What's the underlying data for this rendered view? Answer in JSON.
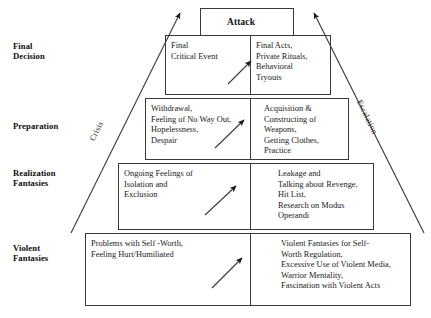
{
  "diagram": {
    "title_box": {
      "label": "Attack"
    },
    "side_labels": {
      "left": "Crisis",
      "right": "Escalation"
    },
    "stages": [
      {
        "name": "final-decision",
        "label": "Final\nDecision",
        "left_cell": "Final\nCritical Event",
        "right_cell": "Final Acts,\nPrivate Rituals,\nBehavioral\nTryouts"
      },
      {
        "name": "preparation",
        "label": "Preparation",
        "left_cell": "Withdrawal,\nFeeling of No Way Out,\nHopelessness,\nDespair",
        "right_cell": "Acquisition &\nConstructing of\nWeapons,\nGetting Clothes,\nPractice"
      },
      {
        "name": "realization-fantasies",
        "label": "Realization\nFantasies",
        "left_cell": "Ongoing Feelings of\nIsolation and\nExclusion",
        "right_cell": "Leakage and\nTalking about Revenge,\nHit List,\nResearch on Modus\nOperandi"
      },
      {
        "name": "violent-fantasies",
        "label": "Violent\nFantasies",
        "left_cell": "Problems with Self -Worth,\nFeeling Hurt/Humiliated",
        "right_cell": "Violent Fantasies for Self-\nWorth Regulation,\nExcessive Use of Violent Media,\nWarrior Mentality,\nFascination with Violent Acts"
      }
    ],
    "colors": {
      "stroke": "#3a3a3a",
      "text": "#1a1a1a",
      "background": "#ffffff"
    }
  }
}
